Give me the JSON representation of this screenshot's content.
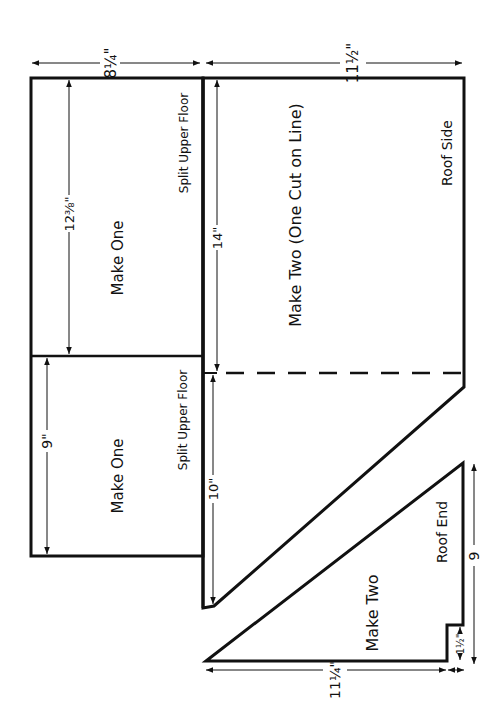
{
  "diagram": {
    "type": "pattern-layout",
    "dimensions": {
      "top_left_width": "8¼\"",
      "top_right_width": "11½\"",
      "upper_floor_a_height": "12⅜\"",
      "upper_floor_b_height": "9\"",
      "roof_side_upper": "14\"",
      "roof_side_lower": "10\"",
      "roof_end_base": "11¼\"",
      "roof_end_notch": "1½\"",
      "roof_end_height": "9"
    },
    "pieces": [
      {
        "id": "upper-floor-a",
        "name": "Split Upper Floor",
        "quantity": "Make One"
      },
      {
        "id": "upper-floor-b",
        "name": "Split Upper Floor",
        "quantity": "Make One"
      },
      {
        "id": "roof-side",
        "name": "Roof Side",
        "quantity": "Make Two (One Cut on Line)"
      },
      {
        "id": "roof-end",
        "name": "Roof End",
        "quantity": "Make Two"
      }
    ]
  }
}
